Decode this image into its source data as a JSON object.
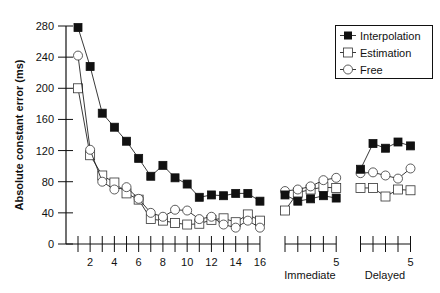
{
  "chart_data": {
    "type": "line",
    "title": "",
    "ylabel": "Absolute constant error (ms)",
    "xlabel": "",
    "ylim": [
      0,
      280
    ],
    "yticks": [
      0,
      40,
      80,
      120,
      160,
      200,
      240,
      280
    ],
    "grid": false,
    "legend_position": "top-right",
    "panels": [
      {
        "name": "Training",
        "label": "",
        "x": [
          1,
          2,
          3,
          4,
          5,
          6,
          7,
          8,
          9,
          10,
          11,
          12,
          13,
          14,
          15,
          16
        ],
        "xtick_labels": [
          "2",
          "4",
          "6",
          "8",
          "10",
          "12",
          "14",
          "16"
        ],
        "xtick_label_positions": [
          2,
          4,
          6,
          8,
          10,
          12,
          14,
          16
        ]
      },
      {
        "name": "Immediate",
        "label": "Immediate",
        "x": [
          1,
          2,
          3,
          4,
          5
        ],
        "xtick_labels": [
          "5"
        ],
        "xtick_label_positions": [
          5
        ]
      },
      {
        "name": "Delayed",
        "label": "Delayed",
        "x": [
          1,
          2,
          3,
          4,
          5
        ],
        "xtick_labels": [
          "5"
        ],
        "xtick_label_positions": [
          5
        ]
      }
    ],
    "series": [
      {
        "name": "Interpolation",
        "marker": "filled-square",
        "values": {
          "Training": [
            278,
            228,
            168,
            150,
            132,
            110,
            87,
            101,
            85,
            77,
            60,
            63,
            62,
            65,
            65,
            55
          ],
          "Immediate": [
            63,
            55,
            58,
            62,
            59
          ],
          "Delayed": [
            96,
            129,
            123,
            131,
            126
          ]
        }
      },
      {
        "name": "Estimation",
        "marker": "open-square",
        "values": {
          "Training": [
            200,
            114,
            88,
            79,
            65,
            57,
            32,
            30,
            27,
            25,
            26,
            31,
            33,
            28,
            38,
            30
          ],
          "Immediate": [
            43,
            66,
            70,
            73,
            72
          ],
          "Delayed": [
            72,
            72,
            61,
            70,
            69
          ]
        }
      },
      {
        "name": "Free",
        "marker": "open-circle",
        "values": {
          "Training": [
            242,
            121,
            80,
            70,
            73,
            58,
            40,
            35,
            44,
            43,
            32,
            35,
            25,
            21,
            30,
            21
          ],
          "Immediate": [
            68,
            70,
            74,
            82,
            85
          ],
          "Delayed": [
            91,
            92,
            88,
            84,
            97
          ]
        }
      }
    ]
  },
  "legend": {
    "items": [
      {
        "label": "Interpolation",
        "marker": "filled-square"
      },
      {
        "label": "Estimation",
        "marker": "open-square"
      },
      {
        "label": "Free",
        "marker": "open-circle"
      }
    ]
  },
  "axis": {
    "ylabel": "Absolute constant error (ms)",
    "immediate_label": "Immediate",
    "delayed_label": "Delayed"
  }
}
